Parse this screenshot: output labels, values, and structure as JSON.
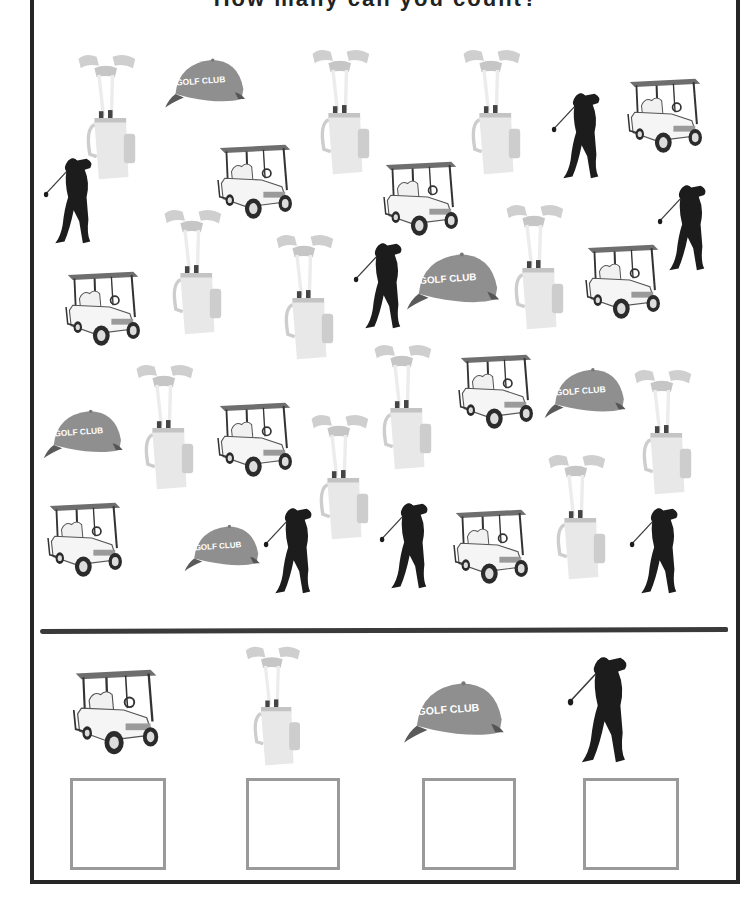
{
  "worksheet": {
    "title": "How many can you count?",
    "colors": {
      "border": "#262626",
      "divider": "#3a3a3a",
      "golfer": "#1c1c1c",
      "cap": "#8f8f8f",
      "bag": "#e6e6e6",
      "box_outline": "#9a9a9a"
    }
  },
  "scatter_items": [
    {
      "type": "bag",
      "x": 72,
      "y": 50,
      "w": 72,
      "h": 136
    },
    {
      "type": "cap",
      "x": 163,
      "y": 55,
      "w": 86,
      "h": 56
    },
    {
      "type": "bag",
      "x": 306,
      "y": 45,
      "w": 72,
      "h": 136
    },
    {
      "type": "bag",
      "x": 457,
      "y": 45,
      "w": 72,
      "h": 136
    },
    {
      "type": "golfer",
      "x": 550,
      "y": 90,
      "w": 56,
      "h": 92
    },
    {
      "type": "cart",
      "x": 622,
      "y": 72,
      "w": 86,
      "h": 84
    },
    {
      "type": "golfer",
      "x": 42,
      "y": 155,
      "w": 56,
      "h": 92
    },
    {
      "type": "cart",
      "x": 212,
      "y": 138,
      "w": 86,
      "h": 84
    },
    {
      "type": "cart",
      "x": 378,
      "y": 155,
      "w": 86,
      "h": 84
    },
    {
      "type": "bag",
      "x": 158,
      "y": 205,
      "w": 72,
      "h": 136
    },
    {
      "type": "bag",
      "x": 270,
      "y": 230,
      "w": 72,
      "h": 136
    },
    {
      "type": "golfer",
      "x": 352,
      "y": 240,
      "w": 56,
      "h": 92
    },
    {
      "type": "cap",
      "x": 405,
      "y": 248,
      "w": 98,
      "h": 66
    },
    {
      "type": "bag",
      "x": 500,
      "y": 200,
      "w": 72,
      "h": 136
    },
    {
      "type": "cart",
      "x": 580,
      "y": 238,
      "w": 86,
      "h": 84
    },
    {
      "type": "golfer",
      "x": 656,
      "y": 182,
      "w": 56,
      "h": 92
    },
    {
      "type": "cart",
      "x": 60,
      "y": 265,
      "w": 86,
      "h": 84
    },
    {
      "type": "bag",
      "x": 130,
      "y": 360,
      "w": 72,
      "h": 136
    },
    {
      "type": "cart",
      "x": 212,
      "y": 396,
      "w": 86,
      "h": 84
    },
    {
      "type": "bag",
      "x": 368,
      "y": 340,
      "w": 72,
      "h": 136
    },
    {
      "type": "cart",
      "x": 453,
      "y": 348,
      "w": 86,
      "h": 84
    },
    {
      "type": "cap",
      "x": 543,
      "y": 363,
      "w": 86,
      "h": 60
    },
    {
      "type": "bag",
      "x": 628,
      "y": 365,
      "w": 72,
      "h": 136
    },
    {
      "type": "cap",
      "x": 42,
      "y": 405,
      "w": 84,
      "h": 58
    },
    {
      "type": "bag",
      "x": 305,
      "y": 410,
      "w": 72,
      "h": 136
    },
    {
      "type": "cart",
      "x": 42,
      "y": 496,
      "w": 86,
      "h": 84
    },
    {
      "type": "cap",
      "x": 183,
      "y": 520,
      "w": 80,
      "h": 56
    },
    {
      "type": "golfer",
      "x": 262,
      "y": 505,
      "w": 56,
      "h": 92
    },
    {
      "type": "golfer",
      "x": 378,
      "y": 500,
      "w": 56,
      "h": 92
    },
    {
      "type": "cart",
      "x": 448,
      "y": 503,
      "w": 86,
      "h": 84
    },
    {
      "type": "bag",
      "x": 542,
      "y": 450,
      "w": 72,
      "h": 136
    },
    {
      "type": "golfer",
      "x": 628,
      "y": 505,
      "w": 56,
      "h": 92
    }
  ],
  "legend": [
    {
      "type": "cart",
      "label": "Golf cart",
      "count_box_value": "",
      "x": 68,
      "y": 660,
      "w": 96,
      "h": 100,
      "box": {
        "x": 70,
        "y": 778,
        "w": 96,
        "h": 92
      }
    },
    {
      "type": "bag",
      "label": "Golf bag",
      "count_box_value": "",
      "x": 238,
      "y": 642,
      "w": 72,
      "h": 130,
      "box": {
        "x": 246,
        "y": 778,
        "w": 94,
        "h": 92
      }
    },
    {
      "type": "cap",
      "label": "Golf cap",
      "count_box_value": "",
      "x": 402,
      "y": 676,
      "w": 106,
      "h": 72,
      "box": {
        "x": 422,
        "y": 778,
        "w": 94,
        "h": 92
      }
    },
    {
      "type": "golfer",
      "label": "Golfer",
      "count_box_value": "",
      "x": 566,
      "y": 652,
      "w": 68,
      "h": 116,
      "box": {
        "x": 583,
        "y": 778,
        "w": 96,
        "h": 92
      }
    }
  ],
  "chart_data": {
    "type": "table",
    "categories": [
      "Golf cart",
      "Golf bag",
      "Golf cap",
      "Golfer"
    ],
    "values": [
      9,
      11,
      5,
      7
    ]
  }
}
